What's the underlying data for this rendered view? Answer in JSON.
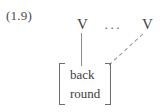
{
  "figure": {
    "equation_number": "(1.9)",
    "type": "autosegmental-association-diagram",
    "tier": {
      "slots": [
        {
          "label": "V",
          "name": "v-slot-left"
        },
        {
          "label": "V",
          "name": "v-slot-right"
        }
      ],
      "ellipsis": "···"
    },
    "association_lines": [
      {
        "style": "solid",
        "from": "v-slot-left",
        "to": "feature-matrix"
      },
      {
        "style": "dashed",
        "from": "feature-matrix",
        "to": "v-slot-right"
      }
    ],
    "feature_matrix": {
      "left_bracket": "[",
      "right_bracket": "]",
      "features": [
        "back",
        "round"
      ]
    },
    "colors": {
      "background": "#ffffff",
      "text": "#3d3d3d",
      "label": "#4a4a4a",
      "solid_line": "#8c8c8c",
      "dashed_line": "#9a9a9a",
      "bracket": "#6e6e6e"
    }
  }
}
